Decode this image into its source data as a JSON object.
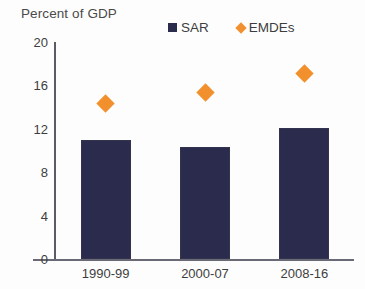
{
  "chart_data": {
    "type": "bar",
    "title": "",
    "ylabel": "Percent of GDP",
    "xlabel": "",
    "categories": [
      "1990-99",
      "2000-07",
      "2008-16"
    ],
    "ylim": [
      0,
      20
    ],
    "yticks": [
      0,
      4,
      8,
      12,
      16,
      20
    ],
    "ytick_labels": [
      "0",
      "4",
      "8",
      "12",
      "16",
      "20"
    ],
    "grid": false,
    "legend_position": "top-right",
    "series": [
      {
        "name": "SAR",
        "type": "bar",
        "color": "#2b2b4d",
        "marker": "square",
        "values": [
          11.0,
          10.3,
          12.1
        ]
      },
      {
        "name": "EMDEs",
        "type": "scatter",
        "color": "#f2902e",
        "marker": "diamond",
        "values": [
          14.3,
          15.3,
          17.1
        ]
      }
    ]
  },
  "legend": {
    "entries": [
      {
        "label": "SAR",
        "color": "#2b2b4d",
        "marker": "square"
      },
      {
        "label": "EMDEs",
        "color": "#f2902e",
        "marker": "diamond"
      }
    ]
  },
  "colors": {
    "sar": "#2b2b4d",
    "emdes": "#f2902e",
    "axis": "#5a5a68",
    "text": "#3d3d3d",
    "background": "#fdfdfd"
  }
}
